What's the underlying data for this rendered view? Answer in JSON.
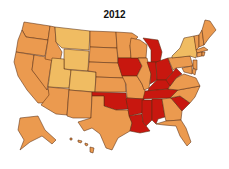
{
  "title": "2012",
  "colors": {
    "low": "#F0BC62",
    "mid": "#EB9A4F",
    "high": "#C8170F",
    "border": "#5a2d12"
  },
  "chart_data": {
    "type": "choropleth",
    "title": "2012",
    "region": "United States",
    "categories": [
      "low",
      "mid",
      "high"
    ],
    "states": {
      "WA": "mid",
      "OR": "mid",
      "CA": "mid",
      "NV": "mid",
      "ID": "mid",
      "MT": "low",
      "WY": "low",
      "UT": "low",
      "CO": "low",
      "AZ": "mid",
      "NM": "mid",
      "ND": "mid",
      "SD": "mid",
      "NE": "mid",
      "KS": "mid",
      "OK": "high",
      "TX": "mid",
      "MN": "mid",
      "IA": "high",
      "MO": "mid",
      "AR": "high",
      "LA": "high",
      "WI": "mid",
      "IL": "mid",
      "MI": "high",
      "IN": "high",
      "OH": "high",
      "KY": "high",
      "TN": "high",
      "MS": "high",
      "AL": "high",
      "GA": "mid",
      "FL": "mid",
      "SC": "high",
      "NC": "mid",
      "VA": "mid",
      "WV": "high",
      "PA": "mid",
      "NY": "low",
      "VT": "mid",
      "NH": "mid",
      "ME": "mid",
      "MA": "mid",
      "CT": "mid",
      "RI": "mid",
      "NJ": "mid",
      "DE": "mid",
      "MD": "mid",
      "AK": "mid",
      "HI": "mid"
    }
  }
}
